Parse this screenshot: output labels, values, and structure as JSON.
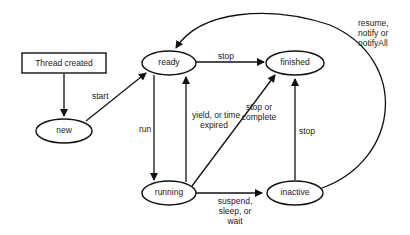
{
  "diagram": {
    "nodes": {
      "thread_created": "Thread created",
      "new": "new",
      "ready": "ready",
      "finished": "finished",
      "running": "running",
      "inactive": "inactive"
    },
    "edges": {
      "created_to_new": "",
      "start": "start",
      "ready_stop": "stop",
      "run": "run",
      "yield_line1": "yield, or time",
      "yield_line2": "expired",
      "stop_complete_line1": "stop or",
      "stop_complete_line2": "complete",
      "inactive_stop": "stop",
      "suspend_line1": "suspend,",
      "suspend_line2": "sleep, or",
      "suspend_line3": "wait",
      "resume_line1": "resume,",
      "resume_line2": "notify or",
      "resume_line3": "notifyAll"
    }
  }
}
